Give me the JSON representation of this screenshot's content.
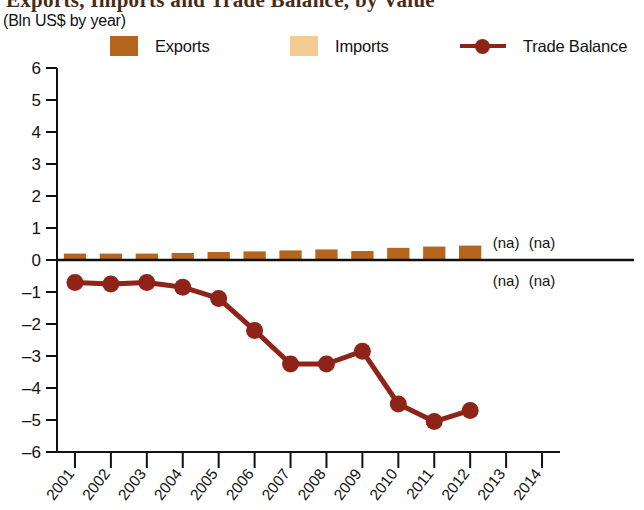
{
  "header": {
    "title": "Exports, Imports and Trade Balance, by Value",
    "subtitle": "(Bln US$ by year)"
  },
  "legend": {
    "position": "top",
    "items": [
      {
        "label": "Exports",
        "color": "#B5651D",
        "marker": "square",
        "name": "legend-exports"
      },
      {
        "label": "Imports",
        "color": "#F3CB93",
        "marker": "square",
        "name": "legend-imports"
      },
      {
        "label": "Trade Balance",
        "color": "#8E2418",
        "marker": "line-dot",
        "name": "legend-trade-balance"
      }
    ]
  },
  "annotations": [
    {
      "text": "(na)",
      "year": "2013",
      "side": "above"
    },
    {
      "text": "(na)",
      "year": "2014",
      "side": "above"
    },
    {
      "text": "(na)",
      "year": "2013",
      "side": "below"
    },
    {
      "text": "(na)",
      "year": "2014",
      "side": "below"
    }
  ],
  "chart_data": {
    "type": "bar",
    "title": "Exports, Imports and Trade Balance, by Value",
    "subtitle": "(Bln US$ by year)",
    "xlabel": "",
    "ylabel": "",
    "ylim": [
      -6,
      6
    ],
    "yticks": [
      6,
      5,
      4,
      3,
      2,
      1,
      0,
      -1,
      -2,
      -3,
      -4,
      -5,
      -6
    ],
    "ytick_labels": [
      "6",
      "5",
      "4",
      "3",
      "2",
      "1",
      "0",
      "–1",
      "–2",
      "–3",
      "–4",
      "–5",
      "–6"
    ],
    "categories": [
      "2001",
      "2002",
      "2003",
      "2004",
      "2005",
      "2006",
      "2007",
      "2008",
      "2009",
      "2010",
      "2011",
      "2012",
      "2013",
      "2014"
    ],
    "grid": false,
    "zero_line": true,
    "series": [
      {
        "name": "Exports",
        "type": "bar",
        "color": "#B5651D",
        "direction": "up",
        "values": [
          0.2,
          0.2,
          0.2,
          0.22,
          0.25,
          0.27,
          0.3,
          0.33,
          0.28,
          0.38,
          0.42,
          0.45,
          null,
          null
        ]
      },
      {
        "name": "Imports",
        "type": "bar",
        "color": "#F3CB93",
        "direction": "down",
        "values": [
          0.9,
          0.95,
          0.9,
          1.07,
          1.45,
          2.47,
          3.55,
          3.58,
          3.13,
          4.88,
          5.47,
          5.15,
          null,
          null
        ]
      },
      {
        "name": "Trade Balance",
        "type": "line",
        "color": "#8E2418",
        "marker": "circle",
        "values": [
          -0.7,
          -0.75,
          -0.7,
          -0.85,
          -1.2,
          -2.2,
          -3.25,
          -3.25,
          -2.85,
          -4.5,
          -5.05,
          -4.7,
          null,
          null
        ]
      }
    ]
  }
}
